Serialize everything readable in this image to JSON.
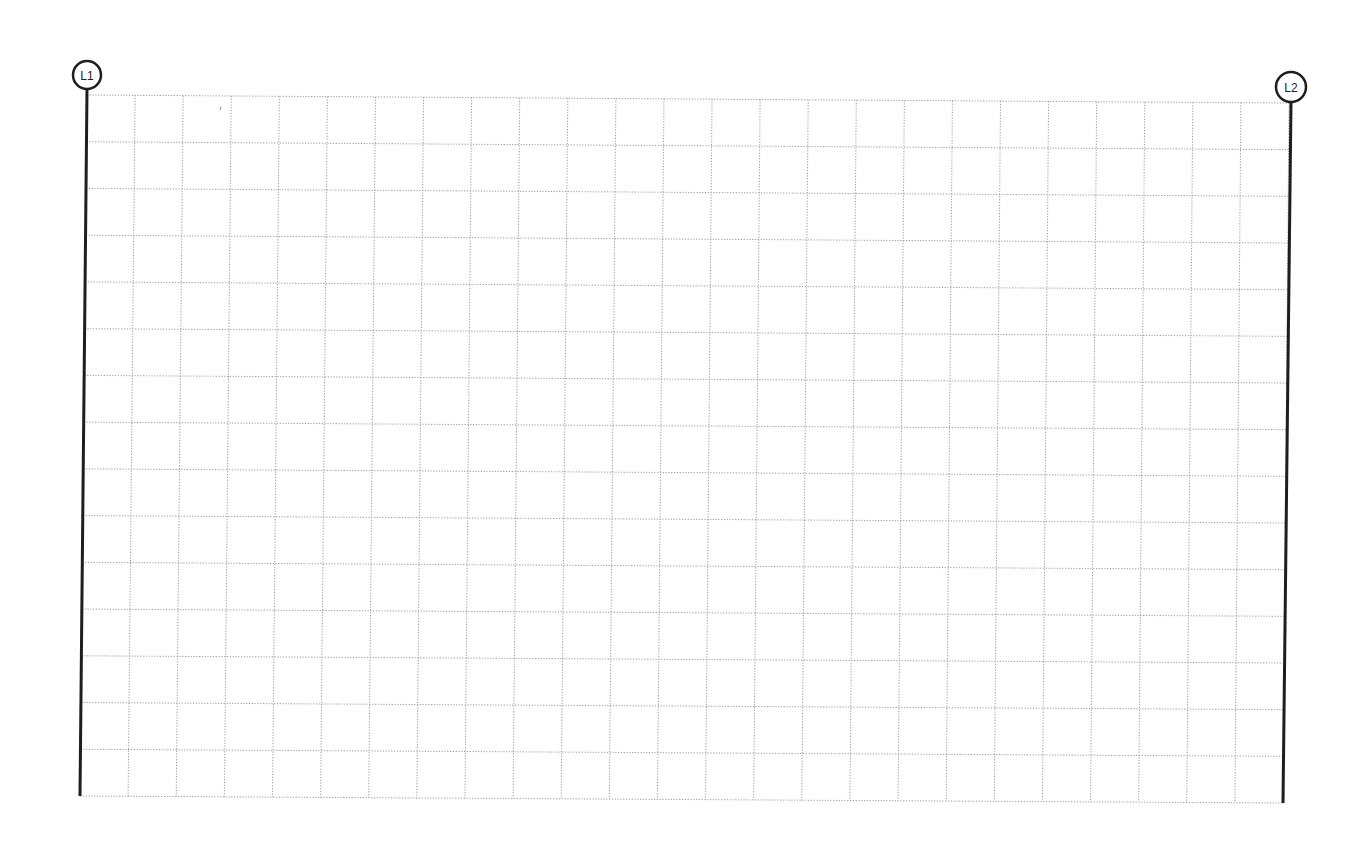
{
  "diagram": {
    "type": "grid-sheet",
    "columns": 25,
    "rows": 15,
    "corners": {
      "top_left": [
        87,
        95
      ],
      "top_right": [
        1289,
        103
      ],
      "bottom_right": [
        1283,
        803
      ],
      "bottom_left": [
        80,
        796
      ]
    },
    "colors": {
      "grid": "#9a9a9a",
      "axis": "#1e1e1e",
      "background": "#ffffff"
    },
    "gridlines": [
      {
        "label": "L1",
        "position": "left",
        "bubble_center": [
          87,
          75
        ],
        "bubble_radius": 14
      },
      {
        "label": "L2",
        "position": "right",
        "bubble_center": [
          1291,
          87
        ],
        "bubble_radius": 15
      }
    ]
  }
}
